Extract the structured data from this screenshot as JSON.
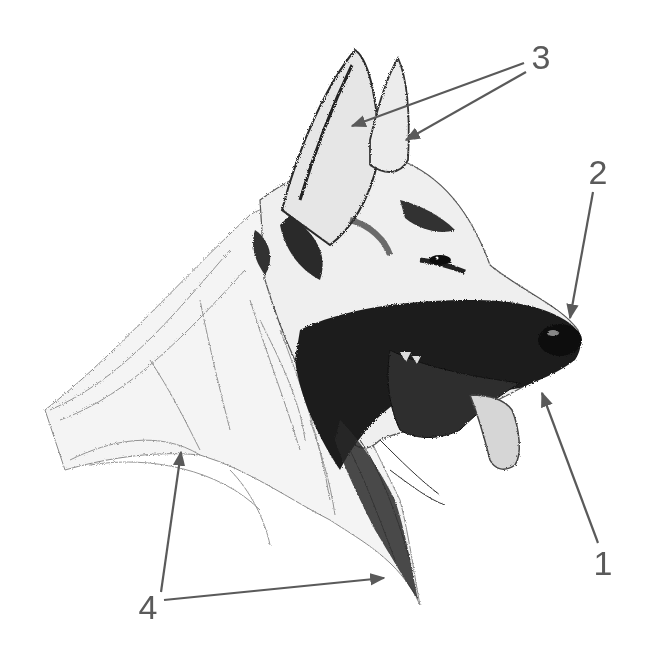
{
  "figure": {
    "background_color": "#ffffff",
    "ink_color": "#1a1a1a",
    "callout_color": "#5a5a5a"
  },
  "callouts": [
    {
      "label": "1",
      "label_pos": [
        603,
        563
      ],
      "arrows": [
        {
          "from": [
            598,
            543
          ],
          "to": [
            542,
            393
          ]
        }
      ]
    },
    {
      "label": "2",
      "label_pos": [
        598,
        172
      ],
      "arrows": [
        {
          "from": [
            593,
            192
          ],
          "to": [
            570,
            318
          ]
        }
      ]
    },
    {
      "label": "3",
      "label_pos": [
        541,
        57
      ],
      "arrows": [
        {
          "from": [
            524,
            63
          ],
          "to": [
            352,
            126
          ]
        },
        {
          "from": [
            526,
            72
          ],
          "to": [
            406,
            140
          ]
        }
      ]
    },
    {
      "label": "4",
      "label_pos": [
        148,
        607
      ],
      "arrows": [
        {
          "from": [
            161,
            592
          ],
          "to": [
            181,
            452
          ]
        },
        {
          "from": [
            164,
            600
          ],
          "to": [
            384,
            578
          ]
        }
      ]
    }
  ]
}
